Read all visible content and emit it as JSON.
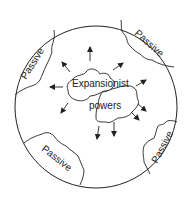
{
  "diagram": {
    "type": "world-circle",
    "stroke_color": "#222222",
    "background": "#ffffff",
    "center": {
      "label_line1": "Expansionist",
      "label_line2": "powers"
    },
    "regions": [
      {
        "id": "top-left",
        "label": "Passive"
      },
      {
        "id": "top-right",
        "label": "Passive"
      },
      {
        "id": "bottom-left",
        "label": "Passive"
      },
      {
        "id": "bottom-right",
        "label": "Passive"
      }
    ],
    "arrow_count": 10
  }
}
